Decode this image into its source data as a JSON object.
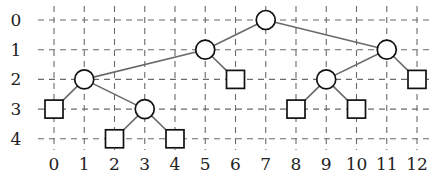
{
  "diagram": {
    "type": "binary-tree-on-grid",
    "x_axis": {
      "labels": [
        "0",
        "1",
        "2",
        "3",
        "4",
        "5",
        "6",
        "7",
        "8",
        "9",
        "10",
        "11",
        "12"
      ]
    },
    "y_axis": {
      "labels": [
        "0",
        "1",
        "2",
        "3",
        "4"
      ]
    },
    "internal_nodes": [
      {
        "id": "n7_0",
        "col": 7,
        "row": 0
      },
      {
        "id": "n5_1",
        "col": 5,
        "row": 1
      },
      {
        "id": "n11_1",
        "col": 11,
        "row": 1
      },
      {
        "id": "n1_2",
        "col": 1,
        "row": 2
      },
      {
        "id": "n9_2",
        "col": 9,
        "row": 2
      },
      {
        "id": "n3_3",
        "col": 3,
        "row": 3
      }
    ],
    "leaf_nodes": [
      {
        "id": "l6_2",
        "col": 6,
        "row": 2
      },
      {
        "id": "l12_2",
        "col": 12,
        "row": 2
      },
      {
        "id": "l0_3",
        "col": 0,
        "row": 3
      },
      {
        "id": "l8_3",
        "col": 8,
        "row": 3
      },
      {
        "id": "l10_3",
        "col": 10,
        "row": 3
      },
      {
        "id": "l2_4",
        "col": 2,
        "row": 4
      },
      {
        "id": "l4_4",
        "col": 4,
        "row": 4
      }
    ],
    "edges": [
      [
        "n7_0",
        "n5_1"
      ],
      [
        "n7_0",
        "n11_1"
      ],
      [
        "n5_1",
        "n1_2"
      ],
      [
        "n5_1",
        "l6_2"
      ],
      [
        "n11_1",
        "n9_2"
      ],
      [
        "n11_1",
        "l12_2"
      ],
      [
        "n1_2",
        "l0_3"
      ],
      [
        "n1_2",
        "n3_3"
      ],
      [
        "n9_2",
        "l8_3"
      ],
      [
        "n9_2",
        "l10_3"
      ],
      [
        "n3_3",
        "l2_4"
      ],
      [
        "n3_3",
        "l4_4"
      ]
    ],
    "colors": {
      "grid": "#6a6a6a",
      "edge": "#6a6a6a",
      "node_stroke": "#111111",
      "node_fill": "#ffffff"
    }
  }
}
